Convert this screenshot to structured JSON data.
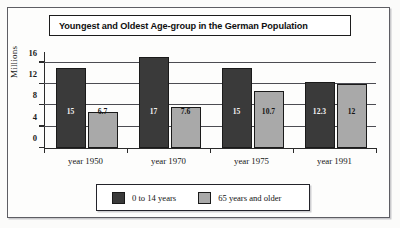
{
  "chart_data": {
    "type": "bar",
    "title": "Youngest and Oldest Age-group in the German Population",
    "xlabel": "",
    "ylabel": "Millions",
    "categories": [
      "year 1950",
      "year 1970",
      "year 1975",
      "year 1991"
    ],
    "series": [
      {
        "name": "0 to 14 years",
        "color": "#3a3a3a",
        "values": [
          15,
          17,
          15,
          12.3
        ],
        "labels": [
          "15",
          "17",
          "15",
          "12.3"
        ]
      },
      {
        "name": "65 years and older",
        "color": "#a9a9a9",
        "values": [
          6.7,
          7.6,
          10.7,
          12
        ],
        "labels": [
          "6.7",
          "7.6",
          "10.7",
          "12"
        ]
      }
    ],
    "ylim": [
      0,
      18
    ],
    "yticks": [
      0,
      4,
      8,
      12,
      16
    ],
    "ytick_labels": [
      "0",
      "4",
      "8",
      "12",
      "16"
    ],
    "grid": true,
    "legend_position": "bottom"
  },
  "legend": {
    "entries": [
      {
        "label": "0 to 14 years",
        "color": "#3a3a3a"
      },
      {
        "label": "65 years and older",
        "color": "#a9a9a9"
      }
    ]
  }
}
